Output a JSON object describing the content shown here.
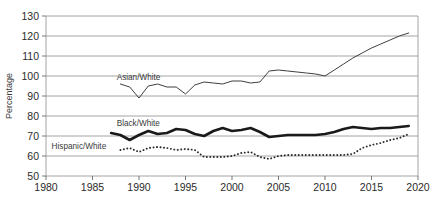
{
  "chart_data": {
    "type": "line",
    "title": "",
    "xlabel": "",
    "ylabel": "Percentage",
    "xlim": [
      1980,
      2020
    ],
    "ylim": [
      50,
      130
    ],
    "xticks": [
      1980,
      1985,
      1990,
      1995,
      2000,
      2005,
      2010,
      2015,
      2020
    ],
    "yticks": [
      50,
      60,
      70,
      80,
      90,
      100,
      110,
      120,
      130
    ],
    "grid": "horizontal",
    "legend": "inline-labels",
    "series": [
      {
        "name": "Asian/White",
        "style": "solid-thin",
        "color": "#3f3f3f",
        "label_x": 1987.6,
        "label_y": 98.2,
        "x": [
          1988,
          1989,
          1990,
          1991,
          1992,
          1993,
          1994,
          1995,
          1996,
          1997,
          1998,
          1999,
          2000,
          2001,
          2002,
          2003,
          2004,
          2005,
          2006,
          2007,
          2008,
          2009,
          2010,
          2011,
          2012,
          2013,
          2014,
          2015,
          2016,
          2017,
          2018,
          2019
        ],
        "values": [
          96.0,
          94.5,
          89.0,
          95.0,
          96.0,
          94.5,
          94.5,
          91.0,
          95.5,
          97.0,
          96.5,
          96.0,
          97.5,
          97.5,
          96.5,
          97.0,
          102.5,
          103.0,
          102.5,
          102.0,
          101.5,
          101.0,
          100.0,
          103.0,
          106.0,
          109.0,
          111.5,
          114.0,
          116.0,
          118.0,
          120.0,
          121.5
        ]
      },
      {
        "name": "Black/White",
        "style": "solid-thick",
        "color": "#1a1a1a",
        "label_x": 1987.6,
        "label_y": 75.0,
        "x": [
          1987,
          1988,
          1989,
          1990,
          1991,
          1992,
          1993,
          1994,
          1995,
          1996,
          1997,
          1998,
          1999,
          2000,
          2001,
          2002,
          2003,
          2004,
          2005,
          2006,
          2007,
          2008,
          2009,
          2010,
          2011,
          2012,
          2013,
          2014,
          2015,
          2016,
          2017,
          2018,
          2019
        ],
        "values": [
          71.5,
          70.5,
          68.0,
          70.5,
          72.5,
          71.0,
          71.5,
          73.5,
          73.0,
          71.0,
          70.0,
          72.5,
          74.0,
          72.5,
          73.0,
          74.0,
          72.0,
          69.5,
          70.0,
          70.5,
          70.5,
          70.5,
          70.5,
          71.0,
          72.0,
          73.5,
          74.5,
          74.0,
          73.5,
          74.0,
          74.0,
          74.5,
          75.0
        ]
      },
      {
        "name": "Hispanic/White",
        "style": "dotted",
        "color": "#2b2b2b",
        "label_x": 1980.6,
        "label_y": 63.5,
        "x": [
          1988,
          1989,
          1990,
          1991,
          1992,
          1993,
          1994,
          1995,
          1996,
          1997,
          1998,
          1999,
          2000,
          2001,
          2002,
          2003,
          2004,
          2005,
          2006,
          2007,
          2008,
          2009,
          2010,
          2011,
          2012,
          2013,
          2014,
          2015,
          2016,
          2017,
          2018,
          2019
        ],
        "values": [
          63.0,
          64.0,
          62.0,
          64.0,
          64.5,
          64.0,
          63.0,
          63.5,
          63.0,
          59.5,
          59.5,
          59.5,
          60.0,
          61.5,
          62.0,
          59.5,
          58.5,
          60.0,
          60.5,
          60.5,
          60.5,
          60.5,
          60.5,
          60.5,
          60.5,
          61.0,
          64.0,
          65.5,
          66.5,
          68.0,
          69.0,
          71.0
        ]
      }
    ]
  },
  "axis": {
    "y_title": "Percentage"
  }
}
